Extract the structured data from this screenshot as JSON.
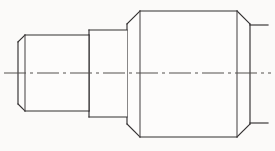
{
  "drawing": {
    "title": "Stepped Shaft Side Elevation",
    "view_type": "side elevation",
    "background_color": "#fbfaf9",
    "line_color": "#333031",
    "centerline_color": "#55504f",
    "canvas": {
      "width": 275,
      "height": 151
    },
    "axis": {
      "name": "horizontal-centerline",
      "style": "dash-dot",
      "y": 73,
      "x_start": 4,
      "x_end": 271
    },
    "sections": [
      {
        "name": "small-left-cylinder",
        "order": 1,
        "x_left": 18,
        "x_right": 89,
        "y_top": 35,
        "y_bottom": 111,
        "chamfer": 7,
        "chamfered_corners": [
          "top-left",
          "bottom-left"
        ],
        "description": "smallest diameter step at left end with chamfered left corners"
      },
      {
        "name": "middle-cylinder",
        "order": 2,
        "x_left": 89,
        "x_right": 127,
        "y_top": 30,
        "y_bottom": 117,
        "chamfer": 0,
        "chamfered_corners": [],
        "description": "intermediate diameter step, square shoulders"
      },
      {
        "name": "large-right-cylinder",
        "order": 3,
        "x_left": 127,
        "x_right": 250,
        "y_top": 11,
        "y_bottom": 137,
        "chamfer": 13,
        "chamfered_corners": [
          "top-left",
          "top-right",
          "bottom-left",
          "bottom-right"
        ],
        "description": "largest diameter body with chamfers on all four corners"
      }
    ],
    "stub_lines": [
      {
        "name": "stub-upper-right",
        "x_start": 250,
        "x_end": 268,
        "y": 25
      },
      {
        "name": "stub-lower-right",
        "x_start": 250,
        "x_end": 268,
        "y": 123
      },
      {
        "name": "stub-upper-left",
        "x_start": 4,
        "x_end": 18,
        "y": 73
      }
    ]
  }
}
